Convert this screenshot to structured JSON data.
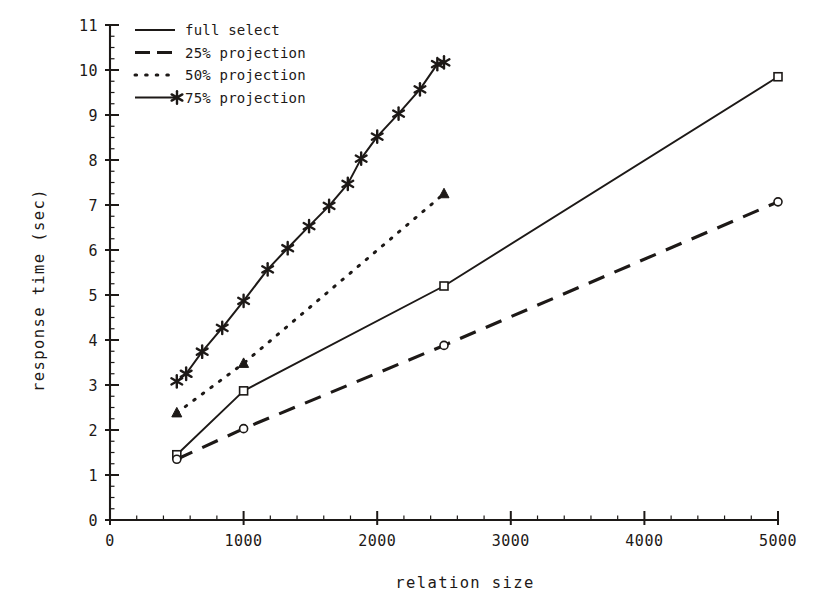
{
  "chart_data": {
    "type": "line",
    "title": "",
    "xlabel": "relation size",
    "ylabel": "response time (sec)",
    "xlim": [
      0,
      5000
    ],
    "ylim": [
      0,
      11
    ],
    "xticks": [
      0,
      1000,
      2000,
      3000,
      4000,
      5000
    ],
    "xtick_labels": [
      "0",
      "1000",
      "2000",
      "3000",
      "4000",
      "5000"
    ],
    "yticks": [
      0,
      1,
      2,
      3,
      4,
      5,
      6,
      7,
      8,
      9,
      10,
      11
    ],
    "ytick_labels": [
      "0",
      "1",
      "2",
      "3",
      "4",
      "5",
      "6",
      "7",
      "8",
      "9",
      "10",
      "11"
    ],
    "x_minor_tick_step": 200,
    "y_minor_tick_step": 0.25,
    "grid": false,
    "legend_position": "top-left",
    "series": [
      {
        "name": "full select",
        "line_style": "solid",
        "marker": "square-open",
        "x": [
          500,
          1000,
          2500,
          5000
        ],
        "y": [
          1.45,
          2.87,
          5.2,
          9.85
        ]
      },
      {
        "name": "25% projection",
        "line_style": "dashed",
        "marker": "circle-open",
        "x": [
          500,
          1000,
          2500,
          5000
        ],
        "y": [
          1.35,
          2.03,
          3.88,
          7.07
        ]
      },
      {
        "name": "50% projection",
        "line_style": "dotted",
        "marker": "triangle",
        "x": [
          500,
          1000,
          2500
        ],
        "y": [
          2.38,
          3.48,
          7.25
        ]
      },
      {
        "name": "75% projection",
        "line_style": "solid-star",
        "marker": "star",
        "x": [
          500,
          570,
          690,
          840,
          1000,
          1180,
          1330,
          1490,
          1640,
          1780,
          1880,
          2000,
          2160,
          2320,
          2450,
          2500
        ],
        "y": [
          3.08,
          3.25,
          3.74,
          4.27,
          4.87,
          5.57,
          6.04,
          6.53,
          6.98,
          7.47,
          8.03,
          8.52,
          9.03,
          9.57,
          10.13,
          10.17
        ]
      }
    ]
  },
  "legend": {
    "items": [
      {
        "label": "full select"
      },
      {
        "label": "25% projection"
      },
      {
        "label": "50% projection"
      },
      {
        "label": "75% projection"
      }
    ]
  }
}
